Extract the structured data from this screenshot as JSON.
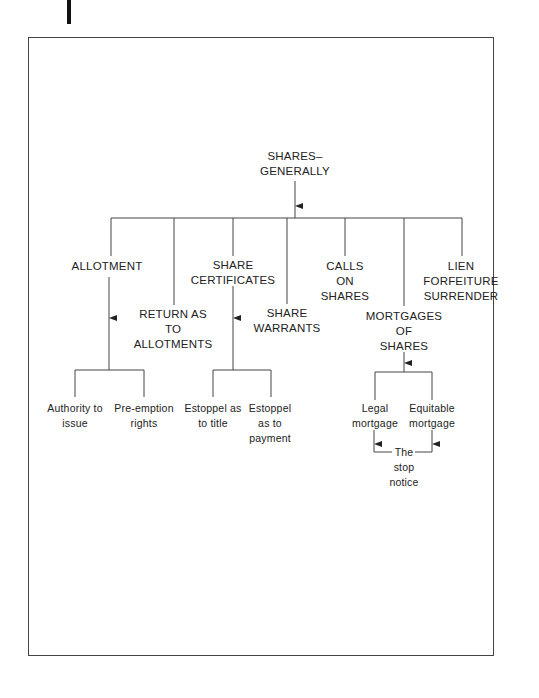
{
  "root": {
    "label": "SHARES–\nGENERALLY"
  },
  "branches": [
    {
      "label": "ALLOTMENT"
    },
    {
      "label": "RETURN AS\nTO\nALLOTMENTS"
    },
    {
      "label": "SHARE\nCERTIFICATES"
    },
    {
      "label": "SHARE\nWARRANTS"
    },
    {
      "label": "CALLS\nON\nSHARES"
    },
    {
      "label": "MORTGAGES\nOF\nSHARES"
    },
    {
      "label": "LIEN\nFORFEITURE\nSURRENDER"
    }
  ],
  "allotment_children": [
    {
      "label": "Authority to\nissue"
    },
    {
      "label": "Pre-emption\nrights"
    }
  ],
  "certificate_children": [
    {
      "label": "Estoppel as\nto title"
    },
    {
      "label": "Estoppel\nas to\npayment"
    }
  ],
  "mortgage_children": [
    {
      "label": "Legal\nmortgage"
    },
    {
      "label": "Equitable\nmortgage"
    }
  ],
  "stop_notice": {
    "label": "The\nstop\nnotice"
  }
}
